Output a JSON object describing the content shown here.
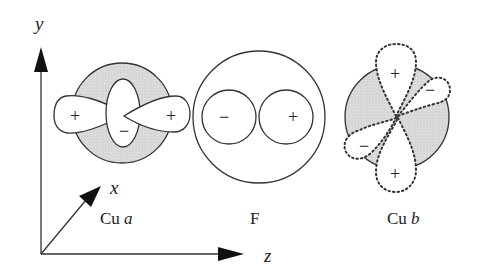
{
  "axes": {
    "y_label": "y",
    "x_label": "x",
    "z_label": "z"
  },
  "sites": [
    {
      "id": "cu_a",
      "label_prefix": "Cu",
      "label_suffix": "a",
      "orbital": "d(x2-y2)-like with central lobe",
      "lobes": [
        {
          "sign": "+"
        },
        {
          "sign": "−"
        },
        {
          "sign": "+"
        }
      ]
    },
    {
      "id": "f",
      "label_prefix": "F",
      "label_suffix": "",
      "orbital": "p",
      "lobes": [
        {
          "sign": "−"
        },
        {
          "sign": "+"
        }
      ]
    },
    {
      "id": "cu_b",
      "label_prefix": "Cu",
      "label_suffix": "b",
      "orbital": "d (rotated, dashed)",
      "lobes": [
        {
          "sign": "+"
        },
        {
          "sign": "−"
        },
        {
          "sign": "−"
        },
        {
          "sign": "+"
        }
      ]
    }
  ],
  "colors": {
    "line": "#333333",
    "shade": "#d6d6d6",
    "background": "#ffffff"
  }
}
